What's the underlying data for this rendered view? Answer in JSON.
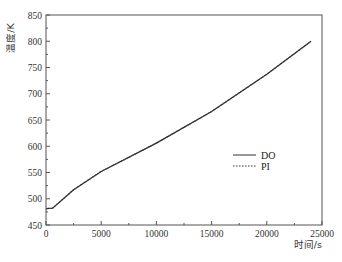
{
  "chart_data": {
    "type": "line",
    "title": "",
    "xlabel": "时间/s",
    "ylabel": "温度/K",
    "xlim": [
      0,
      25000
    ],
    "ylim": [
      450,
      850
    ],
    "xticks": [
      0,
      5000,
      10000,
      15000,
      20000,
      25000
    ],
    "xtick_labels": [
      "0",
      "5000",
      "10000",
      "15000",
      "20000",
      "25000"
    ],
    "yticks": [
      450,
      500,
      550,
      600,
      650,
      700,
      750,
      800,
      850
    ],
    "ytick_labels": [
      "450",
      "500",
      "550",
      "600",
      "650",
      "700",
      "750",
      "800",
      "850"
    ],
    "grid": false,
    "legend_position": "center-right",
    "series": [
      {
        "name": "DO",
        "style": "solid",
        "color": "#222222",
        "x": [
          0,
          600,
          2500,
          5000,
          10000,
          15000,
          20000,
          24000
        ],
        "y": [
          481,
          482,
          517,
          552,
          606,
          666,
          737,
          800
        ]
      },
      {
        "name": "PI",
        "style": "dotted",
        "color": "#444444",
        "x": [
          0,
          600,
          2500,
          5000,
          10000,
          15000,
          20000,
          24000
        ],
        "y": [
          481,
          482,
          517,
          552,
          606,
          666,
          737,
          800
        ]
      }
    ]
  },
  "legend": {
    "items": [
      {
        "label": "DO",
        "style": "solid"
      },
      {
        "label": "PI",
        "style": "dotted"
      }
    ]
  }
}
